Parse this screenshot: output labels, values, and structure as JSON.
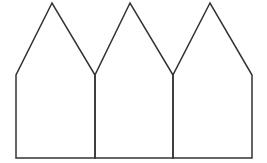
{
  "diagram": {
    "type": "line-drawing",
    "stroke_color": "#333333",
    "background_color": "#ffffff",
    "stroke_width": 1.5,
    "houses": [
      {
        "label": "house-1",
        "peak": [
          52,
          3
        ],
        "eave_left": [
          16,
          75
        ],
        "eave_right": [
          95,
          75
        ],
        "base_left": [
          16,
          158
        ],
        "base_right": [
          95,
          158
        ]
      },
      {
        "label": "house-2",
        "peak": [
          130,
          3
        ],
        "eave_left": [
          95,
          75
        ],
        "eave_right": [
          173,
          75
        ],
        "base_left": [
          95,
          158
        ],
        "base_right": [
          173,
          158
        ]
      },
      {
        "label": "house-3",
        "peak": [
          210,
          3
        ],
        "eave_left": [
          173,
          75
        ],
        "eave_right": [
          252,
          75
        ],
        "base_left": [
          173,
          158
        ],
        "base_right": [
          252,
          158
        ]
      }
    ]
  }
}
